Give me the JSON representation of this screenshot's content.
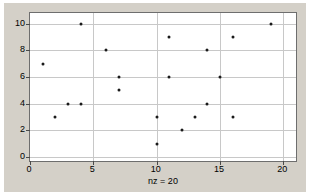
{
  "figure": {
    "background_color": "#d4d0c8",
    "axes_background_color": "#ffffff",
    "axes_border_color": "#6e6e6e",
    "grid_color": "#c8c8c8",
    "marker_color": "#1a1a1a"
  },
  "chart_data": {
    "type": "scatter",
    "title": "",
    "subtitle": "",
    "xlabel": "nz = 20",
    "ylabel": "",
    "xlim": [
      0,
      21
    ],
    "ylim": [
      10.8,
      -0.3
    ],
    "y_axis_inverted": true,
    "grid": true,
    "legend": null,
    "xticks": [
      0,
      5,
      10,
      15,
      20
    ],
    "xtick_labels": [
      "0",
      "5",
      "10",
      "15",
      "20"
    ],
    "yticks": [
      0,
      2,
      4,
      6,
      8,
      10
    ],
    "ytick_labels": [
      "0",
      "2",
      "4",
      "6",
      "8",
      "10"
    ],
    "marker": "dot",
    "marker_size": 3,
    "nz": 20,
    "points": [
      {
        "x": 10,
        "y": 1
      },
      {
        "x": 12,
        "y": 2
      },
      {
        "x": 2,
        "y": 3
      },
      {
        "x": 10,
        "y": 3
      },
      {
        "x": 13,
        "y": 3
      },
      {
        "x": 16,
        "y": 3
      },
      {
        "x": 3,
        "y": 4
      },
      {
        "x": 4,
        "y": 4
      },
      {
        "x": 14,
        "y": 4
      },
      {
        "x": 7,
        "y": 5
      },
      {
        "x": 7,
        "y": 6
      },
      {
        "x": 11,
        "y": 6
      },
      {
        "x": 15,
        "y": 6
      },
      {
        "x": 1,
        "y": 7
      },
      {
        "x": 6,
        "y": 8
      },
      {
        "x": 14,
        "y": 8
      },
      {
        "x": 11,
        "y": 9
      },
      {
        "x": 16,
        "y": 9
      },
      {
        "x": 4,
        "y": 10
      },
      {
        "x": 19,
        "y": 10
      }
    ]
  }
}
